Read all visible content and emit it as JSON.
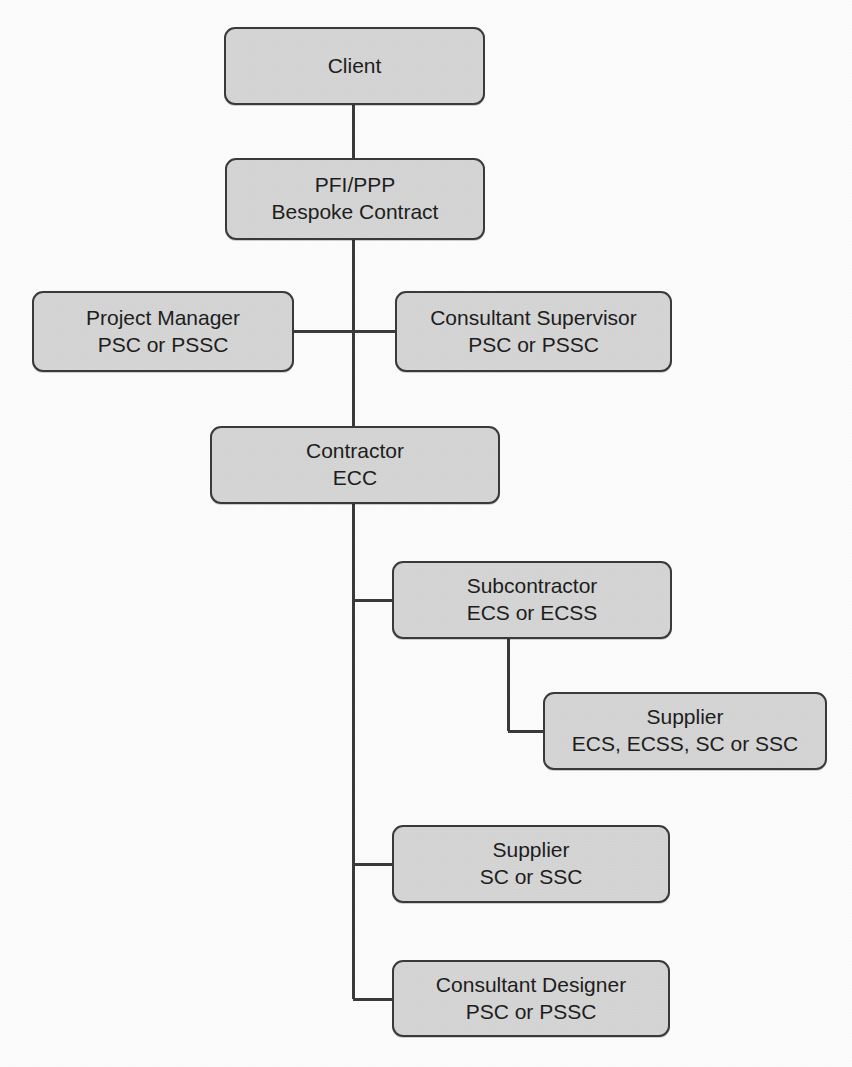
{
  "diagram": {
    "style": {
      "node_fill": "#d6d6d6",
      "node_border": "#3a3a3a",
      "connector_color": "#3a3a3a",
      "background": "#fdfdfd",
      "text_color": "#1d1d1d"
    },
    "nodes": [
      {
        "id": "client",
        "line1": "Client",
        "line2": "",
        "x": 224,
        "y": 27,
        "w": 261,
        "h": 78
      },
      {
        "id": "pfi-ppp",
        "line1": "PFI/PPP",
        "line2": "Bespoke Contract",
        "x": 225,
        "y": 158,
        "w": 260,
        "h": 82
      },
      {
        "id": "project-manager",
        "line1": "Project Manager",
        "line2": "PSC or PSSC",
        "x": 32,
        "y": 291,
        "w": 262,
        "h": 81
      },
      {
        "id": "consultant-supervisor",
        "line1": "Consultant Supervisor",
        "line2": "PSC or PSSC",
        "x": 395,
        "y": 291,
        "w": 277,
        "h": 81
      },
      {
        "id": "contractor",
        "line1": "Contractor",
        "line2": "ECC",
        "x": 210,
        "y": 426,
        "w": 290,
        "h": 78
      },
      {
        "id": "subcontractor",
        "line1": "Subcontractor",
        "line2": "ECS or ECSS",
        "x": 392,
        "y": 561,
        "w": 280,
        "h": 78
      },
      {
        "id": "supplier-ecs",
        "line1": "Supplier",
        "line2": "ECS, ECSS, SC or SSC",
        "x": 543,
        "y": 692,
        "w": 284,
        "h": 78
      },
      {
        "id": "supplier-sc",
        "line1": "Supplier",
        "line2": "SC or SSC",
        "x": 392,
        "y": 825,
        "w": 278,
        "h": 78
      },
      {
        "id": "consultant-designer",
        "line1": "Consultant Designer",
        "line2": "PSC or PSSC",
        "x": 392,
        "y": 960,
        "w": 278,
        "h": 77
      }
    ],
    "connectors": [
      {
        "id": "client-to-pfi",
        "kind": "vertical",
        "x1": 353,
        "y1": 105,
        "x2": 353,
        "y2": 158
      },
      {
        "id": "pfi-to-spine",
        "kind": "vertical",
        "x1": 353,
        "y1": 240,
        "x2": 353,
        "y2": 426
      },
      {
        "id": "spine-to-project-manager",
        "kind": "horizontal",
        "x1": 294,
        "y1": 331,
        "x2": 353,
        "y2": 331
      },
      {
        "id": "spine-to-consultant-supervisor",
        "kind": "horizontal",
        "x1": 353,
        "y1": 331,
        "x2": 395,
        "y2": 331
      },
      {
        "id": "contractor-spine",
        "kind": "vertical",
        "x1": 353,
        "y1": 504,
        "x2": 353,
        "y2": 999
      },
      {
        "id": "spine-to-subcontractor",
        "kind": "horizontal",
        "x1": 353,
        "y1": 600,
        "x2": 392,
        "y2": 600
      },
      {
        "id": "subcontractor-drop",
        "kind": "vertical",
        "x1": 508,
        "y1": 639,
        "x2": 508,
        "y2": 731
      },
      {
        "id": "subcontractor-to-supplier",
        "kind": "horizontal",
        "x1": 508,
        "y1": 731,
        "x2": 543,
        "y2": 731
      },
      {
        "id": "spine-to-supplier-sc",
        "kind": "horizontal",
        "x1": 353,
        "y1": 864,
        "x2": 392,
        "y2": 864
      },
      {
        "id": "spine-to-consultant-designer",
        "kind": "horizontal",
        "x1": 353,
        "y1": 999,
        "x2": 392,
        "y2": 999
      }
    ],
    "caption": ""
  }
}
